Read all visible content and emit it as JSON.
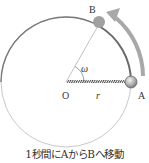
{
  "diagram": {
    "labels": {
      "point_b": "B",
      "point_a": "A",
      "center": "O",
      "radius": "r",
      "angle": "ω"
    },
    "caption": "1秒間にAからBへ移動",
    "colors": {
      "circle": "#c4c4c4",
      "arc_ab": "#6a6a6a",
      "arrow": "#a8a8a8",
      "ball": "#9a9a9a",
      "radius_line": "#555555",
      "text": "#333333"
    }
  }
}
